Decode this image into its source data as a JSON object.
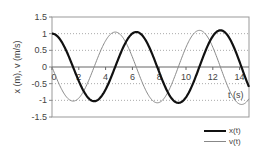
{
  "chart_data": {
    "type": "line",
    "title": "",
    "xlabel": "t (s)",
    "ylabel": "x (m), v (m/s)",
    "xlim": [
      0,
      14.7
    ],
    "ylim": [
      -1.5,
      1.5
    ],
    "x_ticks": [
      "0",
      "2",
      "4",
      "6",
      "8",
      "10",
      "12",
      "14"
    ],
    "y_ticks": [
      "1.5",
      "1",
      "0.5",
      "0",
      "-0.5",
      "-1",
      "-1.5"
    ],
    "grid": "horizontal dotted",
    "legend_position": "bottom-right",
    "series": [
      {
        "name": "x(t)",
        "style": "thick dark",
        "color": "#111111",
        "description": "cosine-like, amplitude slowly growing",
        "points": [
          [
            0,
            1.0
          ],
          [
            1.57,
            0.0
          ],
          [
            3.14,
            -1.03
          ],
          [
            4.71,
            0.0
          ],
          [
            6.28,
            1.05
          ],
          [
            7.85,
            0.0
          ],
          [
            9.42,
            -1.08
          ],
          [
            11.0,
            0.0
          ],
          [
            12.57,
            1.1
          ],
          [
            14.1,
            0.0
          ],
          [
            14.7,
            -0.9
          ]
        ]
      },
      {
        "name": "v(t)",
        "style": "thin gray",
        "color": "#888888",
        "description": "negative-sine-like, amplitude slowly growing",
        "points": [
          [
            0,
            0.0
          ],
          [
            1.57,
            -1.02
          ],
          [
            3.14,
            0.0
          ],
          [
            4.71,
            1.04
          ],
          [
            6.28,
            0.0
          ],
          [
            7.85,
            -1.07
          ],
          [
            9.42,
            0.0
          ],
          [
            11.0,
            1.09
          ],
          [
            12.57,
            0.0
          ],
          [
            14.14,
            -1.12
          ],
          [
            14.7,
            -0.95
          ]
        ]
      }
    ]
  },
  "axes": {
    "xlabel": "t (s)",
    "ylabel": "x (m), v (m/s)",
    "x_ticks": [
      "0",
      "2",
      "4",
      "6",
      "8",
      "10",
      "12",
      "14"
    ],
    "y_ticks": [
      "1.5",
      "1",
      "0.5",
      "0",
      "-0.5",
      "-1",
      "-1.5"
    ]
  },
  "legend": {
    "items": [
      {
        "label": "x(t)"
      },
      {
        "label": "v(t)"
      }
    ]
  }
}
